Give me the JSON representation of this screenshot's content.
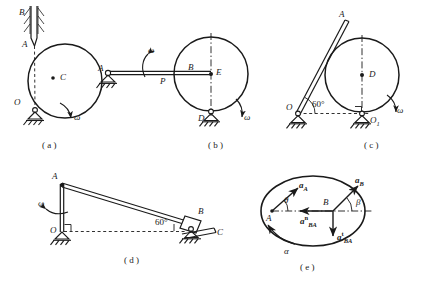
{
  "figure": {
    "background_color": "#ffffff",
    "line_color": "#1a1a1a"
  },
  "panels": [
    {
      "id": "a",
      "caption": "( a )",
      "description": "Disc pinned at O rolling, rod AB sliding in a fixed hatched guide",
      "labels": [
        {
          "name": "point-b",
          "text": "B"
        },
        {
          "name": "point-a",
          "text": "A"
        },
        {
          "name": "point-c",
          "text": "C"
        },
        {
          "name": "point-o",
          "text": "O"
        },
        {
          "name": "omega",
          "text": "ω"
        }
      ]
    },
    {
      "id": "b",
      "caption": "( b )",
      "description": "Rod hinged at A contacting a disc with centre E, disc supported at D",
      "labels": [
        {
          "name": "point-a",
          "text": "A"
        },
        {
          "name": "omega-rod",
          "text": "ω"
        },
        {
          "name": "point-p",
          "text": "P"
        },
        {
          "name": "point-b",
          "text": "B"
        },
        {
          "name": "point-e",
          "text": "E"
        },
        {
          "name": "point-d",
          "text": "D"
        },
        {
          "name": "omega-disc",
          "text": "ω"
        }
      ]
    },
    {
      "id": "c",
      "caption": "( c )",
      "description": "Rod OA inclined at 60 degrees tangent to a disc with centre D resting at O1",
      "labels": [
        {
          "name": "point-a",
          "text": "A"
        },
        {
          "name": "point-d",
          "text": "D"
        },
        {
          "name": "angle-60",
          "text": "60°"
        },
        {
          "name": "point-o",
          "text": "O"
        },
        {
          "name": "point-o1",
          "text": "O"
        },
        {
          "name": "point-o1-sub",
          "text": "1"
        },
        {
          "name": "omega",
          "text": "ω"
        }
      ]
    },
    {
      "id": "d",
      "caption": "( d )",
      "description": "Vertical crank OA rotating with omega, link AB at 60 degrees driving slider B on guide C",
      "labels": [
        {
          "name": "point-a",
          "text": "A"
        },
        {
          "name": "omega",
          "text": "ω"
        },
        {
          "name": "point-o",
          "text": "O"
        },
        {
          "name": "angle-60",
          "text": "60°"
        },
        {
          "name": "point-b",
          "text": "B"
        },
        {
          "name": "point-c",
          "text": "C"
        }
      ]
    },
    {
      "id": "e",
      "caption": "( e )",
      "description": "Acceleration vector diagram for points A and B on a rotating body",
      "labels": [
        {
          "name": "accel-a",
          "text": "a"
        },
        {
          "name": "accel-a-sub",
          "text": "A"
        },
        {
          "name": "accel-b",
          "text": "a"
        },
        {
          "name": "accel-b-sub",
          "text": "B"
        },
        {
          "name": "theta",
          "text": "θ"
        },
        {
          "name": "beta",
          "text": "β"
        },
        {
          "name": "point-a",
          "text": "A"
        },
        {
          "name": "point-b",
          "text": "B"
        },
        {
          "name": "accel-ba-normal",
          "text": "a"
        },
        {
          "name": "accel-ba-normal-sup",
          "text": "n"
        },
        {
          "name": "accel-ba-normal-sub",
          "text": "BA"
        },
        {
          "name": "accel-ba-tangential",
          "text": "a"
        },
        {
          "name": "accel-ba-tangential-sup",
          "text": "t"
        },
        {
          "name": "accel-ba-tangential-sub",
          "text": "BA"
        },
        {
          "name": "alpha",
          "text": "α"
        }
      ]
    }
  ]
}
